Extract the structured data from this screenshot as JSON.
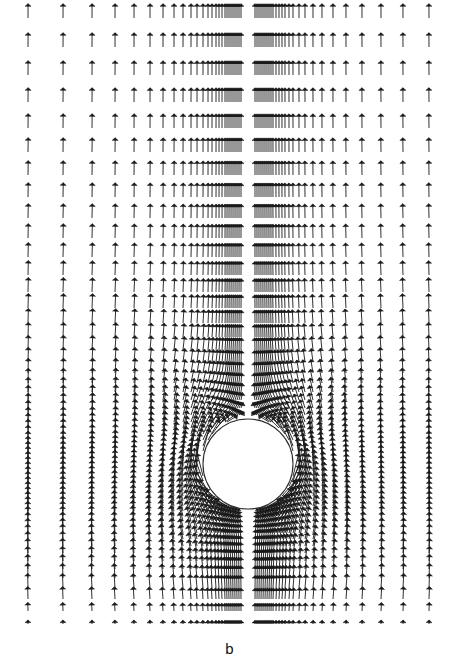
{
  "figure": {
    "panel_label": "b",
    "kind": "vector-field-quiver",
    "caption_position": "bottom-center",
    "background_color": "#ffffff",
    "arrow_color": "#1a1a1a",
    "obstacle_outline_color": "#2b2b2b",
    "obstacle_fill_color": "#ffffff"
  },
  "chart_data": {
    "type": "scatter",
    "title": "",
    "subtitle": "",
    "xlabel": "",
    "ylabel": "",
    "annotations": [
      {
        "text": "b",
        "x": 230,
        "y": 645,
        "role": "panel-label"
      }
    ],
    "legend": [],
    "legend_position": "none",
    "grid": false,
    "xlim": [
      0,
      459
    ],
    "ylim": [
      0,
      659
    ],
    "axis_visible": false,
    "tick_labels_x": [],
    "tick_labels_y": [],
    "plot_box": {
      "x": 18,
      "y": 10,
      "width": 428,
      "height": 622
    },
    "obstacle": {
      "shape": "circle",
      "center_x": 248,
      "center_y": 464,
      "radius": 45,
      "filled": true,
      "outline_width": 1.1
    },
    "glyph": {
      "style": "arrow",
      "head_style": "tee-barb",
      "head_half_width": 3.0,
      "head_length": 2.6,
      "shaft_width": 0.9,
      "points_up": true,
      "max_length_px": 23
    },
    "flow_model": {
      "description": "Potential-type flow past a circular cylinder, oriented upward, on a non-uniform grid clustered near the cylinder and near the lower wall.",
      "free_stream_direction_deg": 90,
      "free_stream_speed": 1.0,
      "wall_boundary": "bottom",
      "wall_damping_height": 40,
      "symmetry_axis_x": 248
    },
    "grid_columns_x": [
      28,
      63,
      92,
      115,
      134,
      150,
      163,
      174,
      183,
      191,
      197,
      203,
      208,
      212,
      216,
      219,
      222,
      225,
      227,
      229,
      231,
      233,
      235,
      237,
      239,
      241,
      255,
      257,
      259,
      261,
      263,
      265,
      267,
      269,
      271,
      273,
      276,
      279,
      282,
      285,
      289,
      293,
      299,
      305,
      313,
      322,
      333,
      346,
      362,
      381,
      403,
      429
    ],
    "grid_rows_y": [
      18,
      47,
      75,
      102,
      128,
      152,
      175,
      197,
      218,
      238,
      257,
      275,
      292,
      308,
      323,
      337,
      350,
      362,
      373,
      383,
      392,
      400,
      408,
      415,
      422,
      428,
      434,
      440,
      446,
      451,
      456,
      461,
      466,
      471,
      476,
      481,
      486,
      491,
      496,
      501,
      506,
      511,
      516,
      521,
      527,
      533,
      539,
      546,
      553,
      561,
      569,
      578,
      588,
      599,
      611,
      624
    ],
    "sample_vectors": [
      {
        "x": 28,
        "y": 18,
        "u": 0.0,
        "v": 1.0,
        "len": 18
      },
      {
        "x": 191,
        "y": 18,
        "u": 0.0,
        "v": 1.0,
        "len": 18
      },
      {
        "x": 429,
        "y": 18,
        "u": 0.0,
        "v": 1.0,
        "len": 18
      },
      {
        "x": 203,
        "y": 392,
        "u": -0.18,
        "v": 0.72,
        "len": 13
      },
      {
        "x": 248,
        "y": 404,
        "u": 0.0,
        "v": 0.3,
        "len": 6
      },
      {
        "x": 299,
        "y": 392,
        "u": 0.18,
        "v": 0.72,
        "len": 13
      },
      {
        "x": 183,
        "y": 464,
        "u": -0.1,
        "v": 1.35,
        "len": 22
      },
      {
        "x": 313,
        "y": 464,
        "u": 0.1,
        "v": 1.35,
        "len": 22
      },
      {
        "x": 248,
        "y": 527,
        "u": 0.0,
        "v": 0.42,
        "len": 8
      },
      {
        "x": 28,
        "y": 624,
        "u": 0.0,
        "v": 0.05,
        "len": 2
      },
      {
        "x": 248,
        "y": 624,
        "u": 0.0,
        "v": 0.04,
        "len": 2
      },
      {
        "x": 429,
        "y": 624,
        "u": 0.0,
        "v": 0.05,
        "len": 2
      }
    ]
  }
}
